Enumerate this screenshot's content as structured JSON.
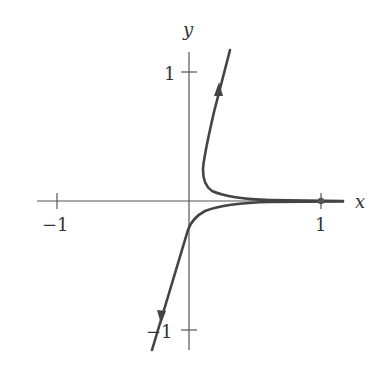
{
  "figure": {
    "axes": {
      "x_label": "x",
      "y_label": "y",
      "x_ticks": [
        {
          "value": -1,
          "label": "−1"
        },
        {
          "value": 1,
          "label": "1"
        }
      ],
      "y_ticks": [
        {
          "value": 1,
          "label": "1"
        },
        {
          "value": -1,
          "label": "−1"
        }
      ]
    },
    "curves": [
      {
        "name": "upper-trajectory",
        "direction": "away from x-axis, upward",
        "arrow": "up"
      },
      {
        "name": "lower-trajectory",
        "direction": "away from x-axis, downward",
        "arrow": "down"
      }
    ],
    "equilibrium_point": {
      "x": 1,
      "y": 0
    },
    "colors": {
      "curve": "#444444",
      "axis": "#555555",
      "text": "#333333"
    }
  }
}
